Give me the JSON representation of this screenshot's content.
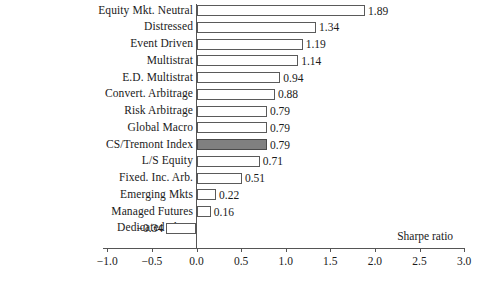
{
  "chart_data": {
    "type": "bar",
    "orientation": "horizontal",
    "title": "",
    "xlabel": "Sharpe ratio",
    "ylabel": "",
    "xlim": [
      -1.0,
      3.0
    ],
    "grid": false,
    "legend": null,
    "xticks": [
      "-1.0",
      "-0.5",
      "0.0",
      "0.5",
      "1.0",
      "1.5",
      "2.0",
      "2.5",
      "3.0"
    ],
    "xtick_values": [
      -1.0,
      -0.5,
      0.0,
      0.5,
      1.0,
      1.5,
      2.0,
      2.5,
      3.0
    ],
    "categories": [
      "Equity Mkt. Neutral",
      "Distressed",
      "Event Driven",
      "Multistrat",
      "E.D. Multistrat",
      "Convert. Arbitrage",
      "Risk Arbitrage",
      "Global Macro",
      "CS/Tremont Index",
      "L/S Equity",
      "Fixed. Inc. Arb.",
      "Emerging Mkts",
      "Managed Futures",
      "Dedicated Short"
    ],
    "values": [
      1.89,
      1.34,
      1.19,
      1.14,
      0.94,
      0.88,
      0.79,
      0.79,
      0.79,
      0.71,
      0.51,
      0.22,
      0.16,
      -0.34
    ],
    "value_labels": [
      "1.89",
      "1.34",
      "1.19",
      "1.14",
      "0.94",
      "0.88",
      "0.79",
      "0.79",
      "0.79",
      "0.71",
      "0.51",
      "0.22",
      "0.16",
      "−0.34"
    ],
    "highlight_index": 8,
    "colors": {
      "bar_fill": "#ffffff",
      "bar_edge": "#5a5a5a",
      "highlight_fill": "#808080",
      "axis": "#555555",
      "text": "#1a1a1a"
    }
  }
}
